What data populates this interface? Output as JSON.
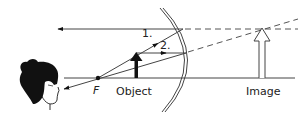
{
  "diagram": {
    "title": "",
    "type": "ray-diagram-concave-mirror-virtual-image",
    "labels": {
      "focal_point": "F",
      "object": "Object",
      "image": "Image",
      "ray1": "1.",
      "ray2": "2."
    },
    "colors": {
      "line": "#333333",
      "fill": "#111111",
      "background": "#ffffff"
    }
  }
}
